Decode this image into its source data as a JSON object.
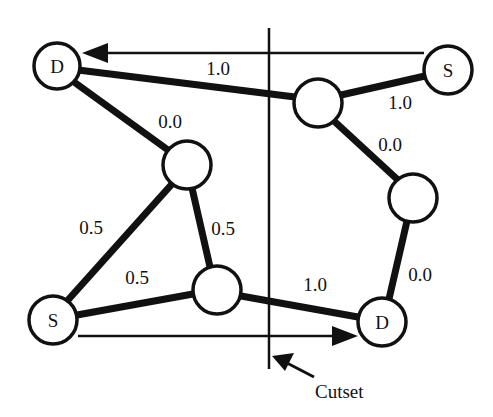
{
  "diagram": {
    "nodes": [
      {
        "id": "d1",
        "label": "D",
        "x": 57,
        "y": 66,
        "r": 23
      },
      {
        "id": "n1",
        "label": "",
        "x": 187,
        "y": 165,
        "r": 24
      },
      {
        "id": "n2",
        "label": "",
        "x": 318,
        "y": 103,
        "r": 24
      },
      {
        "id": "s1",
        "label": "S",
        "x": 448,
        "y": 70,
        "r": 24
      },
      {
        "id": "n3",
        "label": "",
        "x": 413,
        "y": 198,
        "r": 24
      },
      {
        "id": "n4",
        "label": "",
        "x": 217,
        "y": 290,
        "r": 24
      },
      {
        "id": "s2",
        "label": "S",
        "x": 53,
        "y": 320,
        "r": 24
      },
      {
        "id": "d2",
        "label": "D",
        "x": 382,
        "y": 322,
        "r": 24
      }
    ],
    "edges": [
      {
        "from": "d1",
        "to": "n2",
        "weight": "1.0"
      },
      {
        "from": "d1",
        "to": "n1",
        "weight": "0.0"
      },
      {
        "from": "n2",
        "to": "s1",
        "weight": "1.0"
      },
      {
        "from": "n2",
        "to": "n3",
        "weight": "0.0"
      },
      {
        "from": "n1",
        "to": "s2",
        "weight": "0.5"
      },
      {
        "from": "n1",
        "to": "n4",
        "weight": "0.5"
      },
      {
        "from": "s2",
        "to": "n4",
        "weight": "0.5"
      },
      {
        "from": "n4",
        "to": "d2",
        "weight": "1.0"
      },
      {
        "from": "n3",
        "to": "d2",
        "weight": "0.0"
      }
    ],
    "arrows": [
      {
        "from": "s1",
        "to": "d1",
        "direction": "left"
      },
      {
        "from": "s2",
        "to": "d2",
        "direction": "right"
      }
    ],
    "cutset": {
      "label": "Cutset"
    }
  },
  "labels": {
    "d1": "D",
    "s1": "S",
    "s2": "S",
    "d2": "D",
    "e_d1_n2": "1.0",
    "e_d1_n1": "0.0",
    "e_n2_s1": "1.0",
    "e_n2_n3": "0.0",
    "e_n1_s2": "0.5",
    "e_n1_n4": "0.5",
    "e_s2_n4": "0.5",
    "e_n4_d2": "1.0",
    "e_n3_d2": "0.0",
    "cutset": "Cutset"
  }
}
